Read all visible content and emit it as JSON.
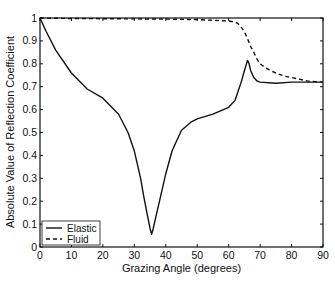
{
  "chart_data": {
    "type": "line",
    "title": "",
    "xlabel": "Grazing Angle (degrees)",
    "ylabel": "Absolute Value of Reflection Coefficient",
    "xlim": [
      0,
      90
    ],
    "ylim": [
      0,
      1
    ],
    "xticks": [
      0,
      10,
      20,
      30,
      40,
      50,
      60,
      70,
      80,
      90
    ],
    "yticks": [
      0,
      0.1,
      0.2,
      0.3,
      0.4,
      0.5,
      0.6,
      0.7,
      0.8,
      0.9,
      1
    ],
    "xtick_labels": [
      "0",
      "10",
      "20",
      "30",
      "40",
      "50",
      "60",
      "70",
      "80",
      "90"
    ],
    "ytick_labels": [
      "0",
      "0.1",
      "0.2",
      "0.3",
      "0.4",
      "0.5",
      "0.6",
      "0.7",
      "0.8",
      "0.9",
      "1"
    ],
    "grid": false,
    "legend_position": "lower left",
    "series": [
      {
        "name": "Elastic",
        "style": "solid",
        "color": "#111111",
        "x": [
          0,
          2,
          5,
          10,
          15,
          20,
          25,
          28,
          30,
          32,
          33,
          34,
          35,
          35.5,
          36,
          37,
          38,
          40,
          42,
          45,
          48,
          50,
          55,
          60,
          62,
          63,
          64,
          65,
          66,
          66.5,
          67,
          68,
          69,
          70,
          75,
          80,
          85,
          90
        ],
        "y": [
          1.0,
          0.94,
          0.86,
          0.76,
          0.69,
          0.65,
          0.58,
          0.5,
          0.42,
          0.3,
          0.22,
          0.15,
          0.08,
          0.055,
          0.08,
          0.14,
          0.2,
          0.32,
          0.42,
          0.51,
          0.545,
          0.56,
          0.58,
          0.61,
          0.64,
          0.68,
          0.72,
          0.77,
          0.815,
          0.8,
          0.77,
          0.74,
          0.725,
          0.72,
          0.715,
          0.72,
          0.72,
          0.72
        ]
      },
      {
        "name": "Fluid",
        "style": "dashed",
        "color": "#111111",
        "x": [
          0,
          10,
          20,
          30,
          40,
          50,
          55,
          60,
          62,
          63,
          64,
          65,
          66,
          67,
          68,
          69,
          70,
          72,
          75,
          78,
          80,
          85,
          90
        ],
        "y": [
          1.0,
          0.998,
          0.997,
          0.996,
          0.995,
          0.993,
          0.99,
          0.987,
          0.982,
          0.975,
          0.96,
          0.94,
          0.91,
          0.875,
          0.85,
          0.82,
          0.8,
          0.78,
          0.76,
          0.745,
          0.74,
          0.725,
          0.72
        ]
      }
    ]
  },
  "legend": {
    "items": [
      {
        "label": "Elastic",
        "style": "solid"
      },
      {
        "label": "Fluid",
        "style": "dashed"
      }
    ]
  },
  "axes": {
    "xlabel": "Grazing Angle (degrees)",
    "ylabel": "Absolute Value of Reflection Coefficient"
  }
}
